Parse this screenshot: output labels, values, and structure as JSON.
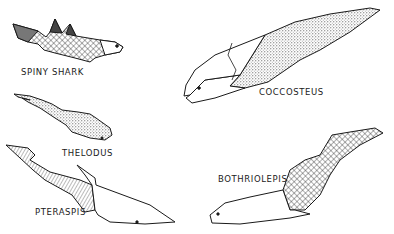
{
  "figure": {
    "colors": {
      "ink": "#1a1a1a",
      "background": "#ffffff"
    },
    "labels": [
      {
        "id": "spiny-shark",
        "text": "SPINY SHARK"
      },
      {
        "id": "coccosteus",
        "text": "COCCOSTEUS"
      },
      {
        "id": "thelodus",
        "text": "THELODUS"
      },
      {
        "id": "bothriolepis",
        "text": "BOTHRIOLEPIS"
      },
      {
        "id": "pteraspis",
        "text": "PTERASPIS"
      }
    ]
  }
}
